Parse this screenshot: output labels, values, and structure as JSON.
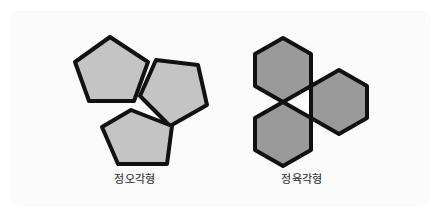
{
  "figure": {
    "canvas": {
      "width": 441,
      "height": 216,
      "background_color": "#ffffff",
      "panel_color": "#fbfbfb"
    },
    "outline_color": "#111111",
    "groups": [
      {
        "id": "pentagon-group",
        "label": "정오각형",
        "shape_name": "regular-pentagon",
        "count": 3,
        "fill_color": "#c4c4c4",
        "tessellates": false,
        "note": "three regular pentagons meeting at a point leaving an angular gap",
        "polygons": [
          {
            "name": "pentagon-top-left",
            "points": "110,37 148,62 134,101 89,101 75,62"
          },
          {
            "name": "pentagon-right",
            "points": "156,60 198,65 207,105 170,126 140,96"
          },
          {
            "name": "pentagon-bottom",
            "points": "131,110 172,126 167,164 118,164 102,127"
          }
        ]
      },
      {
        "id": "hexagon-group",
        "label": "정육각형",
        "shape_name": "regular-hexagon",
        "count": 3,
        "fill_color": "#9a9a9a",
        "tessellates": true,
        "note": "three regular hexagons sharing edges with no gaps",
        "polygons": [
          {
            "name": "hexagon-top-left",
            "points": "283,38 311,54 311,86 283,102 255,86 255,54"
          },
          {
            "name": "hexagon-right",
            "points": "339,70 367,86 367,118 339,134 311,118 311,86"
          },
          {
            "name": "hexagon-bottom-left",
            "points": "283,102 311,118 311,150 283,166 255,150 255,118"
          }
        ]
      }
    ]
  }
}
